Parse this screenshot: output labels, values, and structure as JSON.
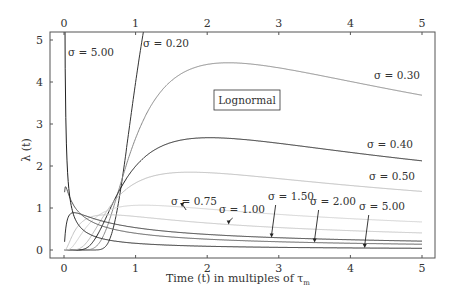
{
  "chart_data": {
    "type": "line",
    "title": "",
    "box_label": "Lognormal",
    "xlabel": "Time (t) in multiples of τ",
    "xlabel_sub": "m",
    "ylabel": "λ (t)",
    "xlim": [
      -0.2,
      5.3
    ],
    "ylim": [
      -0.2,
      5.2
    ],
    "xticks": [
      0,
      1,
      2,
      3,
      4,
      5
    ],
    "xtick_labels": [
      "0",
      "1",
      "2",
      "3",
      "4",
      "5"
    ],
    "yticks": [
      0,
      1,
      2,
      3,
      4,
      5
    ],
    "ytick_labels": [
      "0",
      "1",
      "2",
      "3",
      "4",
      "5"
    ],
    "grid": false,
    "legend": "none",
    "function": "lognormal hazard rate, median = 1 τm",
    "series": [
      {
        "name": "σ = 0.20",
        "sigma": 0.2,
        "color": "#333333"
      },
      {
        "name": "σ = 0.30",
        "sigma": 0.3,
        "color": "#888888"
      },
      {
        "name": "σ = 0.40",
        "sigma": 0.4,
        "color": "#222222"
      },
      {
        "name": "σ = 0.50",
        "sigma": 0.5,
        "color": "#bbbbbb"
      },
      {
        "name": "σ = 0.75",
        "sigma": 0.75,
        "color": "#d0d0d0"
      },
      {
        "name": "σ = 1.00",
        "sigma": 1.0,
        "color": "#c4c4c4"
      },
      {
        "name": "σ = 1.50",
        "sigma": 1.5,
        "color": "#333333"
      },
      {
        "name": "σ = 2.00",
        "sigma": 2.0,
        "color": "#555555"
      },
      {
        "name": "σ = 5.00",
        "sigma": 5.0,
        "color": "#222222"
      }
    ],
    "annotations": [
      {
        "text": "σ = 5.00",
        "series": "σ = 5.00",
        "position": "top-left, near t=0"
      },
      {
        "text": "σ = 0.20",
        "series": "σ = 0.20",
        "position": "top, near t=1.1"
      },
      {
        "text": "σ = 0.30",
        "series": "σ = 0.30",
        "position": "right, above curve"
      },
      {
        "text": "σ = 0.40",
        "series": "σ = 0.40",
        "position": "right, above curve"
      },
      {
        "text": "σ = 0.50",
        "series": "σ = 0.50",
        "position": "right, above curve"
      },
      {
        "text": "σ = 0.75",
        "series": "σ = 0.75",
        "arrow_to_t": 1.65
      },
      {
        "text": "σ = 1.00",
        "series": "σ = 1.00",
        "arrow_to_t": 2.3
      },
      {
        "text": "σ = 1.50",
        "series": "σ = 1.50",
        "arrow_to_t": 2.9
      },
      {
        "text": "σ = 2.00",
        "series": "σ = 2.00",
        "arrow_to_t": 3.5
      },
      {
        "text": "σ = 5.00",
        "series": "σ = 5.00",
        "arrow_to_t": 4.2
      }
    ]
  }
}
